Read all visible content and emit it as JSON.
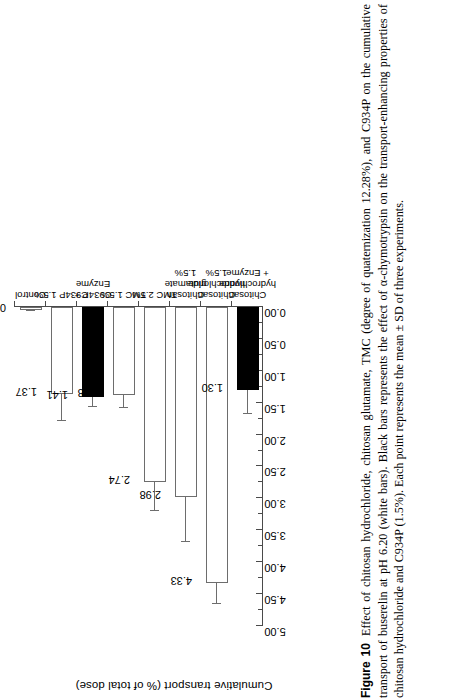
{
  "figure": {
    "label": "Figure 10",
    "caption": "Effect of chitosan hydrochloride, chitosan glutamate, TMC (degree of quaternization 12.28%), and C934P on the cumulative transport of buserelin at pH 6.20 (white bars). Black bars represents the effect of α-chymotrypsin on the transport-enhancing properties of chitosan hydrochloride and C934P (1.5%). Each point represents the mean ± SD of three experiments."
  },
  "chart_data": {
    "type": "bar",
    "orientation": "vertical",
    "title": "",
    "xlabel": "",
    "ylabel": "Cumulative transport (% of total dose)",
    "ylim": [
      0.0,
      5.0
    ],
    "ytick_step": 0.5,
    "ytick_labels": [
      "0.00",
      "0.50",
      "1.00",
      "1.50",
      "2.00",
      "2.50",
      "3.00",
      "3.50",
      "4.00",
      "4.50",
      "5.00"
    ],
    "ytick_values": [
      0.0,
      0.5,
      1.0,
      1.5,
      2.0,
      2.5,
      3.0,
      3.5,
      4.0,
      4.5,
      5.0
    ],
    "minor_ticks": true,
    "grid": false,
    "legend": null,
    "categories": [
      "Control",
      "C934P 1.5%",
      "C934P + Enzyme",
      "TMC 1.5%",
      "TMC 2.5%",
      "Chitosan glutamate 1.5%",
      "Chitosan hydrochloride 1.5%",
      "Chitosan hydrochloride + Enzyme"
    ],
    "category_lines": [
      [
        "Control"
      ],
      [
        "C934P 1.5%"
      ],
      [
        "C934P +",
        "Enzyme"
      ],
      [
        "TMC 1.5%"
      ],
      [
        "TMC 2.5%"
      ],
      [
        "Chitosan",
        "glutamate",
        "1.5%"
      ],
      [
        "Chitosan",
        "hydrochloride",
        "1.5%"
      ],
      [
        "Chitosan",
        "hydrochloride",
        "+ Enzyme"
      ]
    ],
    "values": [
      0.04,
      1.37,
      1.41,
      1.38,
      2.74,
      2.98,
      4.33,
      1.3
    ],
    "value_labels": [
      "0.04",
      "1.37",
      "1.41",
      "1.38",
      "2.74",
      "2.98",
      "4.33",
      "1.30"
    ],
    "errors": [
      0.03,
      0.42,
      0.15,
      0.2,
      0.45,
      0.7,
      0.33,
      0.38
    ],
    "bar_styles": [
      "white",
      "white",
      "black",
      "white",
      "white",
      "white",
      "white",
      "black"
    ],
    "colors": {
      "white_bar_fill": "#ffffff",
      "white_bar_edge": "#6d6d6d",
      "black_bar_fill": "#000000",
      "axis": "#4a4a4a",
      "text": "#000000",
      "background": "#ffffff"
    },
    "series": [
      {
        "name": "Cumulative transport (% of total dose)",
        "values": [
          0.04,
          1.37,
          1.41,
          1.38,
          2.74,
          2.98,
          4.33,
          1.3
        ]
      }
    ]
  }
}
